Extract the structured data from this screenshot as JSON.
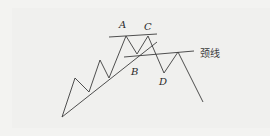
{
  "diagram": {
    "type": "head-and-shoulders-top pattern",
    "labels": {
      "A": "A",
      "B": "B",
      "C": "C",
      "D": "D",
      "neckline": "颈线"
    },
    "colors": {
      "line": "#3c3c3c",
      "background": "#f2f2f0",
      "text": "#2a2a2a"
    },
    "price_path": [
      [
        62,
        117
      ],
      [
        75,
        78
      ],
      [
        89,
        92
      ],
      [
        100,
        60
      ],
      [
        109,
        78
      ],
      [
        126,
        36
      ],
      [
        137,
        54
      ],
      [
        148,
        36
      ],
      [
        164,
        73
      ],
      [
        178,
        52
      ],
      [
        203,
        102
      ]
    ],
    "lines": {
      "top_resistance": [
        [
          109,
          37
        ],
        [
          157,
          34
        ]
      ],
      "neckline": [
        [
          124,
          57
        ],
        [
          194,
          51
        ]
      ],
      "uptrend": [
        [
          62,
          117
        ],
        [
          157,
          42
        ]
      ]
    }
  }
}
